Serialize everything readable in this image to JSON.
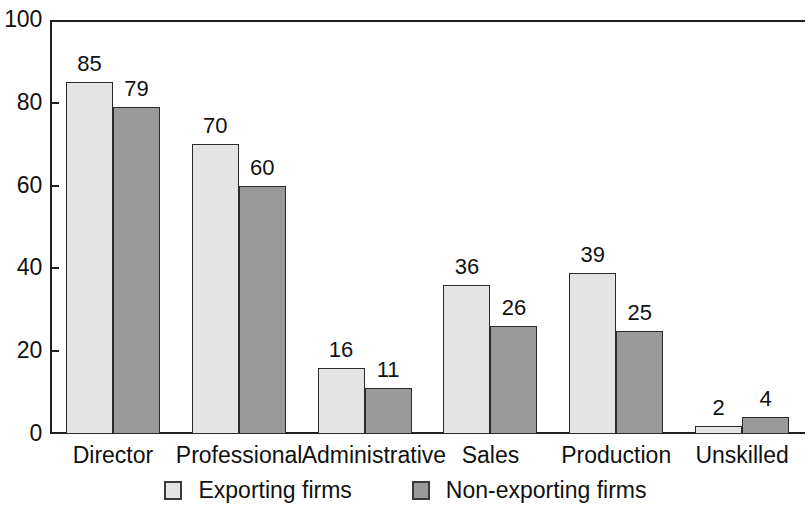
{
  "chart_data": {
    "type": "bar",
    "title": "",
    "subtitle": "",
    "xlabel": "",
    "ylabel": "",
    "categories": [
      "Director",
      "Professional",
      "Administrative",
      "Sales",
      "Production",
      "Unskilled"
    ],
    "series": [
      {
        "name": "Exporting firms",
        "color": "#e4e4e4",
        "values": [
          85,
          70,
          16,
          36,
          39,
          2
        ]
      },
      {
        "name": "Non-exporting firms",
        "color": "#9a9a9a",
        "values": [
          79,
          60,
          11,
          26,
          25,
          4
        ]
      }
    ],
    "ylim": [
      0,
      100
    ],
    "y_ticks": [
      0,
      20,
      40,
      60,
      80,
      100
    ],
    "y_tick_labels": [
      "0",
      "20",
      "40",
      "60",
      "80",
      "100"
    ],
    "grid": false,
    "legend_position": "bottom",
    "value_labels": true,
    "axis_color": "#1f1f1f",
    "background": "#ffffff"
  },
  "legend": {
    "items": [
      {
        "label": "Exporting firms",
        "swatch": "light"
      },
      {
        "label": "Non-exporting firms",
        "swatch": "dark"
      }
    ]
  }
}
